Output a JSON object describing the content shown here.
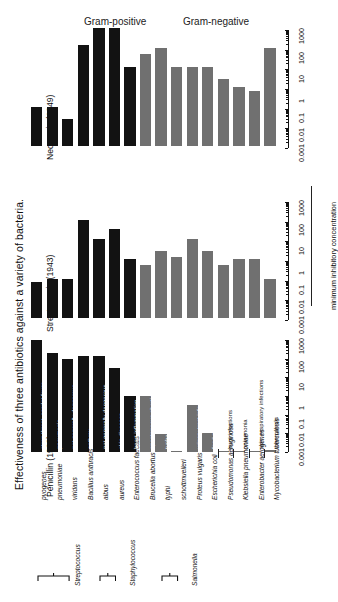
{
  "figure": {
    "title": "Effectiveness of three antibiotics against a variety of bacteria.",
    "axis_label": "minimum inhibitory concentration",
    "group_headers": [
      {
        "label": "Gram-positive"
      },
      {
        "label": "Gram-negative"
      }
    ],
    "colors": {
      "gram_positive": "#121212",
      "gram_negative": "#707070",
      "text": "#111111",
      "background": "#ffffff"
    }
  },
  "panels": [
    {
      "key": "neomycin",
      "title": "Neomycin (1949)"
    },
    {
      "key": "streptomycin",
      "title": "Streptomycin (1943)"
    },
    {
      "key": "penicillin",
      "title": "Penicillin (1928)"
    }
  ],
  "axis": {
    "type": "log",
    "ticks": [
      "0.001",
      "0.01",
      "0.1",
      "1",
      "10",
      "100",
      "1000"
    ],
    "min": 0.001,
    "max": 1000
  },
  "genus_groups": [
    {
      "label": "Streptococcus",
      "members": [
        "pyogenes",
        "pneumoniae",
        "viridans"
      ]
    },
    {
      "label": "Staphylococcus",
      "members": [
        "albus",
        "aureus"
      ]
    },
    {
      "label": "Salmonella",
      "members": [
        "typhi",
        "schottmuelleri"
      ]
    }
  ],
  "species": [
    {
      "name": "Streptococcus pyogenes",
      "short": "pyogenes",
      "gram": "positive",
      "disease": "strep throat, scarlet fever",
      "disease_on_bar": true
    },
    {
      "name": "Streptococcus pneumoniae",
      "short": "pneumoniae",
      "gram": "positive",
      "disease": "pneumonia",
      "disease_on_bar": true
    },
    {
      "name": "Streptococcus viridans",
      "short": "viridans",
      "gram": "positive",
      "disease": "not generally dangerous",
      "disease_on_bar": true
    },
    {
      "name": "Bacillus anthracis",
      "short": "Bacillus anthracis",
      "gram": "positive",
      "disease": "anthrax",
      "disease_on_bar": true
    },
    {
      "name": "Staphylococcus albus",
      "short": "albus",
      "gram": "positive",
      "disease": "not generally dangerous",
      "disease_on_bar": true
    },
    {
      "name": "Staphylococcus aureus",
      "short": "aureus",
      "gram": "positive",
      "disease": "skin diseases",
      "disease_on_bar": true
    },
    {
      "name": "Enterococcus faecalis",
      "short": "Enterococcus faecalis",
      "gram": "positive",
      "disease": "heart inflammation",
      "disease_on_bar": true
    },
    {
      "name": "Brucella abortus",
      "short": "Brucella abortus",
      "gram": "negative",
      "disease": "spontaneous abortion in cattle",
      "disease_on_bar": true
    },
    {
      "name": "Salmonella typhi",
      "short": "typhi",
      "gram": "negative",
      "disease": "typhoid fever",
      "disease_on_bar": true
    },
    {
      "name": "Salmonella schottmuelleri",
      "short": "schottmuelleri",
      "gram": "negative",
      "disease": "paratyphoid fever",
      "disease_on_bar": true
    },
    {
      "name": "Proteus vulgaris",
      "short": "Proteus vulgaris",
      "gram": "negative",
      "disease": "urinary tract infections",
      "disease_on_bar": true
    },
    {
      "name": "Escherichia coli",
      "short": "Escherichia coli",
      "gram": "negative",
      "disease": "food poisoning",
      "disease_on_bar": true
    },
    {
      "name": "Pseudomonas aeruginosa",
      "short": "Pseudomonas aeruginosa",
      "gram": "negative",
      "disease": "burn infections",
      "disease_on_bar": false
    },
    {
      "name": "Klebsiella pneumoniae",
      "short": "Klebsiella pneumoniae",
      "gram": "negative",
      "disease": "pneumonia",
      "disease_on_bar": false
    },
    {
      "name": "Enterobacter aerogenes",
      "short": "Enterobacter aerogenes",
      "gram": "negative",
      "disease": "skin, respiratory infections",
      "disease_on_bar": false
    },
    {
      "name": "Mycobacterium tuberculosis",
      "short": "Mycobacterium tuberculosis",
      "gram": "negative",
      "disease": "tuberculosis",
      "disease_on_bar": false
    }
  ],
  "chart_data": {
    "type": "bar",
    "title": "Effectiveness of three antibiotics against a variety of bacteria.",
    "xlabel": "",
    "ylabel": "minimum inhibitory concentration",
    "scale": "log",
    "ylim": [
      0.001,
      1000
    ],
    "grid": false,
    "legend": [
      "Gram-positive",
      "Gram-negative"
    ],
    "note": "Bar length encodes effectiveness = decreasing MIC (lower MIC = longer bar).",
    "categories": [
      "Streptococcus pyogenes",
      "Streptococcus pneumoniae",
      "Streptococcus viridans",
      "Bacillus anthracis",
      "Staphylococcus albus",
      "Staphylococcus aureus",
      "Enterococcus faecalis",
      "Brucella abortus",
      "Salmonella typhi",
      "Salmonella schottmuelleri",
      "Proteus vulgaris",
      "Escherichia coli",
      "Pseudomonas aeruginosa",
      "Klebsiella pneumoniae",
      "Enterobacter aerogenes",
      "Mycobacterium tuberculosis"
    ],
    "series": [
      {
        "name": "Neomycin (1949)",
        "units": "MIC",
        "values": [
          10.0,
          10.0,
          40.0,
          0.007,
          0.001,
          0.001,
          0.1,
          0.02,
          0.01,
          0.1,
          0.1,
          0.1,
          0.4,
          1.0,
          1.6,
          0.01
        ]
      },
      {
        "name": "Streptomycin (1943)",
        "units": "MIC",
        "values": [
          14.0,
          11.0,
          10.0,
          0.01,
          0.1,
          0.03,
          1.0,
          2.0,
          0.4,
          0.8,
          0.1,
          0.4,
          2.0,
          1.0,
          1.0,
          10.0
        ]
      },
      {
        "name": "Penicillin (1928)",
        "units": "MIC",
        "values": [
          0.001,
          0.005,
          0.01,
          0.007,
          0.007,
          0.03,
          1.0,
          1.0,
          110.0,
          850.0,
          3.0,
          100.0,
          850.0,
          850.0,
          850.0,
          800.0
        ]
      }
    ]
  }
}
